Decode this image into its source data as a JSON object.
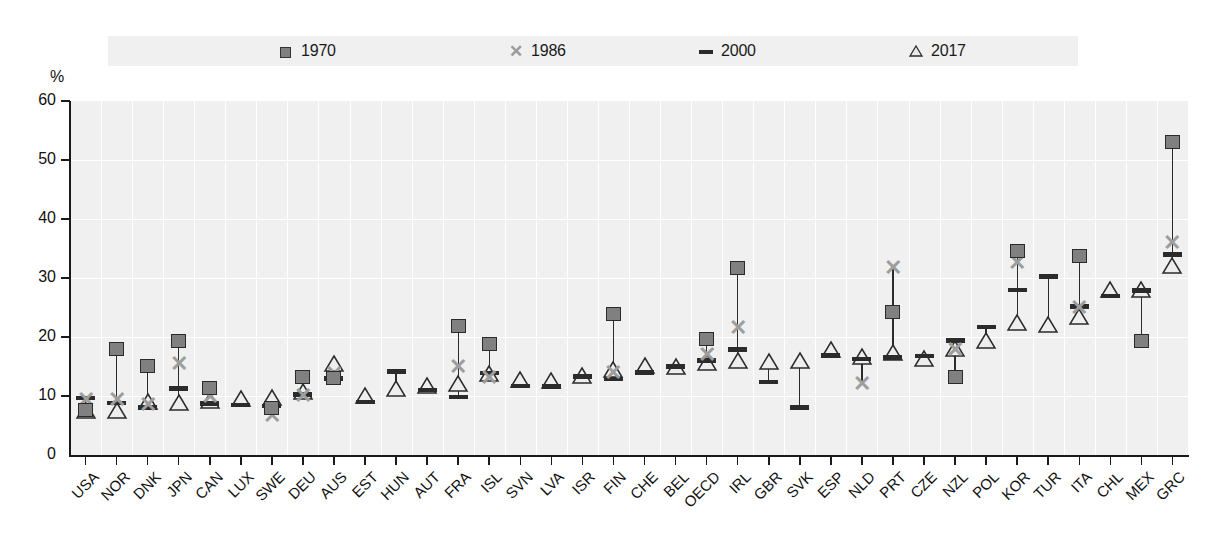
{
  "legend": {
    "items": [
      {
        "label": "1970",
        "symbol": "square-marker",
        "color": "#808080"
      },
      {
        "label": "1986",
        "symbol": "cross-marker",
        "color": "#9d9d9d"
      },
      {
        "label": "2000",
        "symbol": "dash-marker",
        "color": "#2b2b2b"
      },
      {
        "label": "2017",
        "symbol": "triangle-marker",
        "color": "#e8e8e8"
      }
    ]
  },
  "axis": {
    "y_unit": "%",
    "y_ticks": [
      "60",
      "50",
      "40",
      "30",
      "20",
      "10",
      "0"
    ]
  },
  "chart_data": {
    "type": "scatter",
    "title": "",
    "xlabel": "",
    "ylabel": "%",
    "ylim": [
      0,
      60
    ],
    "grid": true,
    "legend_position": "top",
    "categories": [
      "USA",
      "NOR",
      "DNK",
      "JPN",
      "CAN",
      "LUX",
      "SWE",
      "DEU",
      "AUS",
      "EST",
      "HUN",
      "AUT",
      "FRA",
      "ISL",
      "SVN",
      "LVA",
      "ISR",
      "FIN",
      "CHE",
      "BEL",
      "OECD",
      "IRL",
      "GBR",
      "SVK",
      "ESP",
      "NLD",
      "PRT",
      "CZE",
      "NZL",
      "POL",
      "KOR",
      "TUR",
      "ITA",
      "CHL",
      "MEX",
      "GRC"
    ],
    "series": [
      {
        "name": "1970",
        "values": [
          7.7,
          18.0,
          15.1,
          19.3,
          11.3,
          null,
          8.0,
          13.2,
          13.0,
          null,
          null,
          null,
          21.8,
          18.8,
          null,
          null,
          null,
          23.9,
          null,
          null,
          19.7,
          31.7,
          null,
          null,
          null,
          null,
          24.3,
          null,
          13.2,
          null,
          34.5,
          null,
          33.8,
          null,
          19.3,
          53.0
        ]
      },
      {
        "name": "1986",
        "values": [
          9.3,
          9.3,
          8.5,
          15.5,
          9.9,
          null,
          6.6,
          10.0,
          13.8,
          null,
          null,
          null,
          15.0,
          13.0,
          null,
          null,
          null,
          13.9,
          null,
          null,
          16.9,
          21.5,
          null,
          null,
          null,
          12.0,
          31.7,
          null,
          17.8,
          null,
          32.5,
          null,
          25.0,
          null,
          null,
          36.0
        ]
      },
      {
        "name": "2000",
        "values": [
          9.7,
          8.8,
          8.1,
          11.3,
          8.7,
          8.5,
          8.3,
          10.3,
          13.0,
          9.0,
          14.2,
          11.0,
          9.8,
          13.9,
          11.7,
          11.6,
          13.3,
          12.9,
          14.0,
          15.0,
          16.0,
          17.9,
          12.4,
          8.1,
          16.9,
          16.3,
          16.5,
          16.8,
          19.4,
          21.7,
          28.0,
          30.3,
          25.2,
          27.0,
          27.9,
          34.0
        ]
      },
      {
        "name": "2017",
        "values": [
          6.5,
          6.5,
          8.0,
          7.8,
          8.1,
          8.4,
          8.6,
          9.6,
          14.4,
          9.0,
          10.2,
          10.6,
          11.0,
          12.7,
          11.7,
          11.6,
          12.4,
          13.4,
          14.0,
          13.9,
          14.5,
          15.0,
          14.8,
          14.9,
          16.7,
          15.6,
          16.2,
          15.3,
          17.0,
          18.3,
          21.3,
          21.0,
          22.3,
          27.0,
          27.0,
          31.0
        ]
      }
    ]
  }
}
